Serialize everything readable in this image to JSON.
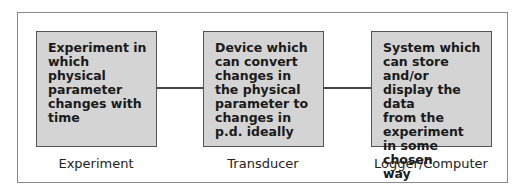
{
  "diagram": {
    "type": "block-flow",
    "stages": [
      {
        "label": "Experiment",
        "description": "Experiment in\nwhich physical\nparameter\nchanges with\ntime"
      },
      {
        "label": "Transducer",
        "description": "Device which\ncan convert\nchanges in\nthe physical\nparameter to\nchanges in\np.d. ideally"
      },
      {
        "label": "Logger/Computer",
        "description": "System which\ncan store and/or\ndisplay the data\nfrom the\nexperiment\nin some chosen\nway"
      }
    ],
    "connections": [
      {
        "from": "Experiment",
        "to": "Transducer"
      },
      {
        "from": "Transducer",
        "to": "Logger/Computer"
      }
    ],
    "colors": {
      "box_fill": "#d4d4d4",
      "box_border": "#555555",
      "frame_border": "#8a8a8a"
    }
  }
}
